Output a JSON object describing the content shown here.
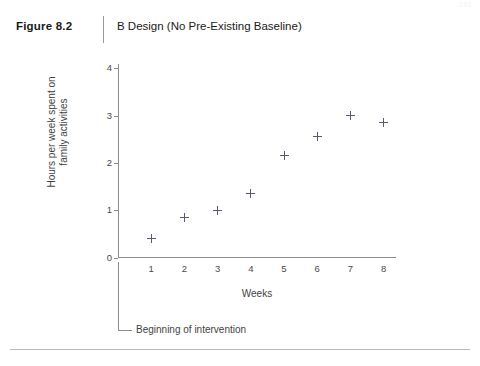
{
  "page": {
    "number": "182"
  },
  "header": {
    "figure_number": "Figure 8.2",
    "title": "B Design (No Pre-Existing Baseline)"
  },
  "annotation": {
    "intervention_label": "Beginning of intervention"
  },
  "chart_data": {
    "type": "scatter",
    "title": "B Design (No Pre-Existing Baseline)",
    "xlabel": "Weeks",
    "ylabel_line1": "Hours per week spent on",
    "ylabel_line2": "family activities",
    "categories": [
      "1",
      "2",
      "3",
      "4",
      "5",
      "6",
      "7",
      "8"
    ],
    "x": [
      1,
      2,
      3,
      4,
      5,
      6,
      7,
      8
    ],
    "values": [
      0.4,
      0.85,
      1.0,
      1.35,
      2.15,
      2.55,
      3.0,
      2.85
    ],
    "xlim": [
      0,
      8.5
    ],
    "ylim": [
      0,
      4.3
    ],
    "xticks": [
      "1",
      "2",
      "3",
      "4",
      "5",
      "6",
      "7",
      "8"
    ],
    "yticks": [
      "0",
      "1",
      "2",
      "3",
      "4"
    ],
    "ytick_values": [
      0,
      1,
      2,
      3,
      4
    ],
    "grid": false,
    "legend": false,
    "marker": "plus",
    "marker_color": "#5a5a6e",
    "axis_color": "#8c8c8c",
    "annotations": [
      {
        "text": "Beginning of intervention",
        "target_x": 0,
        "description": "leader line from x-axis origin down to label"
      }
    ]
  }
}
